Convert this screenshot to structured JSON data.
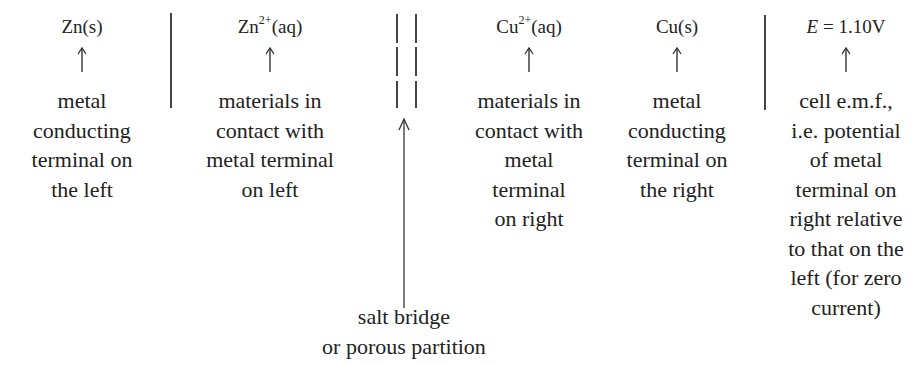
{
  "diagram": {
    "type": "cell-notation-annotation",
    "cell_notation": "Zn(s) | Zn2+(aq) || Cu2+(aq) | Cu(s)   E = 1.10V",
    "columns": [
      {
        "species_base": "Zn",
        "species_sup": "",
        "species_tail": "(s)",
        "description_lines": [
          "metal",
          "conducting",
          "terminal on",
          "the left"
        ]
      },
      {
        "species_base": "Zn",
        "species_sup": "2+",
        "species_tail": "(aq)",
        "description_lines": [
          "materials in",
          "contact with",
          "metal terminal",
          "on left"
        ]
      },
      {
        "species_base": "Cu",
        "species_sup": "2+",
        "species_tail": "(aq)",
        "description_lines": [
          "materials in",
          "contact with",
          "metal",
          "terminal",
          "on right"
        ]
      },
      {
        "species_base": "Cu",
        "species_sup": "",
        "species_tail": "(s)",
        "description_lines": [
          "metal",
          "conducting",
          "terminal on",
          "the right"
        ]
      },
      {
        "species_italic": "E",
        "species_tail": " = 1.10V",
        "description_lines": [
          "cell e.m.f.,",
          "i.e. potential",
          "of metal",
          "terminal on",
          "right relative",
          "to that on the",
          "left (for zero",
          "current)"
        ]
      }
    ],
    "salt_bridge": {
      "symbol": "||",
      "label_lines": [
        "salt bridge",
        "or porous partition"
      ]
    },
    "phase_boundaries": [
      "|",
      "|"
    ],
    "colors": {
      "text": "#222222",
      "lines": "#444444",
      "background": "#ffffff"
    }
  }
}
